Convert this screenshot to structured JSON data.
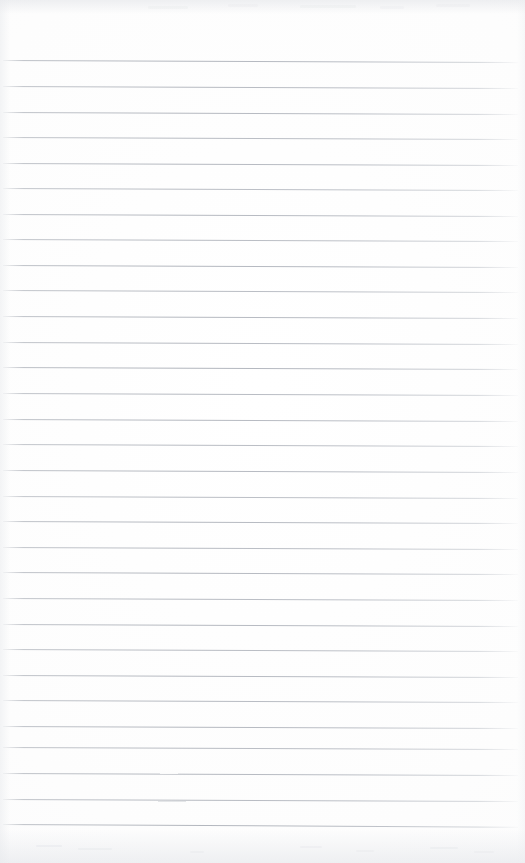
{
  "document": {
    "type": "scanned-image",
    "subject": "blank ruled notebook page",
    "title": "Scanned Ruled Notebook Page",
    "page_width": 525,
    "page_height": 863,
    "has_text": false,
    "has_handwriting": false,
    "visible_text": ""
  },
  "paper": {
    "background_color": "#fdfdfd",
    "edge_tint_color": "#e6e8ec",
    "top_margin_px": 60,
    "bottom_margin_px": 39,
    "left_margin_px": 3,
    "right_margin_px": 7
  },
  "ruling": {
    "style": "wide-ruled horizontal lines",
    "line_color": "#acb0b8",
    "line_thickness_px": 1,
    "line_count": 30,
    "first_line_y": 60,
    "spacing_px": 25.5,
    "line_start_x": 3,
    "line_end_x": 518,
    "skew_degrees": 0.22,
    "has_vertical_margin_rule": false,
    "lines": [
      {
        "index": 1,
        "y": 60,
        "x": 3,
        "width": 515,
        "skew": 0.24,
        "opacity": 0.92
      },
      {
        "index": 2,
        "y": 86,
        "x": 3,
        "width": 515,
        "skew": 0.22,
        "opacity": 0.88
      },
      {
        "index": 3,
        "y": 112,
        "x": 3,
        "width": 515,
        "skew": 0.22,
        "opacity": 0.9
      },
      {
        "index": 4,
        "y": 137,
        "x": 3,
        "width": 515,
        "skew": 0.22,
        "opacity": 0.86
      },
      {
        "index": 5,
        "y": 163,
        "x": 3,
        "width": 515,
        "skew": 0.22,
        "opacity": 0.9
      },
      {
        "index": 6,
        "y": 188,
        "x": 3,
        "width": 515,
        "skew": 0.22,
        "opacity": 0.84
      },
      {
        "index": 7,
        "y": 214,
        "x": 3,
        "width": 515,
        "skew": 0.22,
        "opacity": 0.9
      },
      {
        "index": 8,
        "y": 239,
        "x": 3,
        "width": 515,
        "skew": 0.22,
        "opacity": 0.86
      },
      {
        "index": 9,
        "y": 265,
        "x": 3,
        "width": 515,
        "skew": 0.22,
        "opacity": 0.92
      },
      {
        "index": 10,
        "y": 290,
        "x": 3,
        "width": 515,
        "skew": 0.22,
        "opacity": 0.86
      },
      {
        "index": 11,
        "y": 316,
        "x": 3,
        "width": 515,
        "skew": 0.22,
        "opacity": 0.9
      },
      {
        "index": 12,
        "y": 342,
        "x": 3,
        "width": 515,
        "skew": 0.22,
        "opacity": 0.88
      },
      {
        "index": 13,
        "y": 367,
        "x": 3,
        "width": 515,
        "skew": 0.22,
        "opacity": 0.94
      },
      {
        "index": 14,
        "y": 393,
        "x": 3,
        "width": 515,
        "skew": 0.22,
        "opacity": 0.88
      },
      {
        "index": 15,
        "y": 419,
        "x": 3,
        "width": 515,
        "skew": 0.22,
        "opacity": 0.9
      },
      {
        "index": 16,
        "y": 444,
        "x": 3,
        "width": 515,
        "skew": 0.22,
        "opacity": 0.86
      },
      {
        "index": 17,
        "y": 470,
        "x": 3,
        "width": 515,
        "skew": 0.22,
        "opacity": 0.9
      },
      {
        "index": 18,
        "y": 496,
        "x": 3,
        "width": 515,
        "skew": 0.22,
        "opacity": 0.84
      },
      {
        "index": 19,
        "y": 521,
        "x": 3,
        "width": 515,
        "skew": 0.22,
        "opacity": 0.9
      },
      {
        "index": 20,
        "y": 547,
        "x": 3,
        "width": 515,
        "skew": 0.22,
        "opacity": 0.86
      },
      {
        "index": 21,
        "y": 572,
        "x": 3,
        "width": 515,
        "skew": 0.22,
        "opacity": 0.9
      },
      {
        "index": 22,
        "y": 598,
        "x": 3,
        "width": 515,
        "skew": 0.22,
        "opacity": 0.86
      },
      {
        "index": 23,
        "y": 624,
        "x": 3,
        "width": 515,
        "skew": 0.22,
        "opacity": 0.9
      },
      {
        "index": 24,
        "y": 649,
        "x": 3,
        "width": 515,
        "skew": 0.22,
        "opacity": 0.86
      },
      {
        "index": 25,
        "y": 675,
        "x": 3,
        "width": 515,
        "skew": 0.22,
        "opacity": 0.9
      },
      {
        "index": 26,
        "y": 700,
        "x": 3,
        "width": 515,
        "skew": 0.22,
        "opacity": 0.88
      },
      {
        "index": 27,
        "y": 726,
        "x": 3,
        "width": 515,
        "skew": 0.22,
        "opacity": 0.9
      },
      {
        "index": 28,
        "y": 747,
        "x": 3,
        "width": 515,
        "skew": 0.22,
        "opacity": 0.86
      },
      {
        "index": 29,
        "y": 773,
        "x": 3,
        "width": 515,
        "skew": 0.22,
        "opacity": 0.9
      },
      {
        "index": 30,
        "y": 799,
        "x": 3,
        "width": 515,
        "skew": 0.22,
        "opacity": 0.88
      },
      {
        "index": 31,
        "y": 824,
        "x": 3,
        "width": 515,
        "skew": 0.3,
        "opacity": 0.92
      }
    ]
  },
  "artifacts": {
    "description": "faint scan marks and pencil traces",
    "dashes": [
      {
        "name": "pencil-dash-lower-left",
        "x": 158,
        "y": 801,
        "width": 28,
        "opacity": 0.75
      }
    ],
    "gaps": [
      {
        "name": "rule-break-line-29",
        "x": 160,
        "y": 772,
        "width": 18
      }
    ],
    "specks": [
      {
        "x": 36,
        "y": 845,
        "w": 26,
        "h": 2,
        "opacity": 0.5
      },
      {
        "x": 78,
        "y": 848,
        "w": 34,
        "h": 2,
        "opacity": 0.42
      },
      {
        "x": 190,
        "y": 851,
        "w": 14,
        "h": 2,
        "opacity": 0.38
      },
      {
        "x": 300,
        "y": 846,
        "w": 22,
        "h": 2,
        "opacity": 0.4
      },
      {
        "x": 356,
        "y": 850,
        "w": 18,
        "h": 2,
        "opacity": 0.36
      },
      {
        "x": 430,
        "y": 847,
        "w": 28,
        "h": 2,
        "opacity": 0.42
      },
      {
        "x": 474,
        "y": 851,
        "w": 20,
        "h": 2,
        "opacity": 0.35
      },
      {
        "x": 148,
        "y": 6,
        "w": 40,
        "h": 3,
        "opacity": 0.3
      },
      {
        "x": 228,
        "y": 4,
        "w": 30,
        "h": 3,
        "opacity": 0.28
      },
      {
        "x": 300,
        "y": 5,
        "w": 56,
        "h": 3,
        "opacity": 0.3
      },
      {
        "x": 380,
        "y": 6,
        "w": 24,
        "h": 3,
        "opacity": 0.26
      },
      {
        "x": 436,
        "y": 4,
        "w": 34,
        "h": 3,
        "opacity": 0.28
      }
    ]
  }
}
